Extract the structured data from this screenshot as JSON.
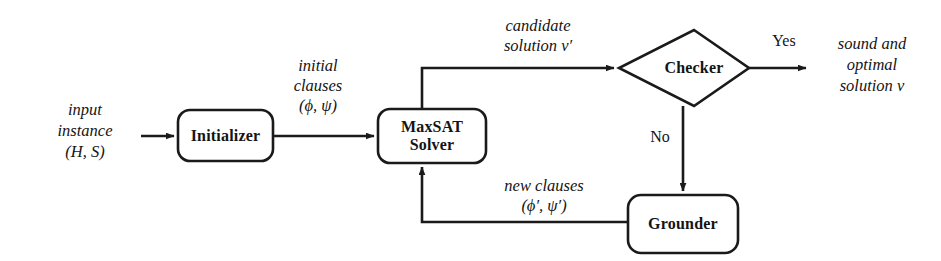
{
  "diagram": {
    "stroke_color": "#1a1a1a",
    "background_color": "#ffffff",
    "nodes": [
      {
        "id": "initializer",
        "label": "Initializer",
        "shape": "rounded-rect"
      },
      {
        "id": "maxsat_solver",
        "label": "MaxSAT\nSolver",
        "shape": "rounded-rect"
      },
      {
        "id": "checker",
        "label": "Checker",
        "shape": "diamond"
      },
      {
        "id": "grounder",
        "label": "Grounder",
        "shape": "rounded-rect"
      }
    ],
    "io": {
      "input": "input\ninstance\n(H, S)",
      "output": "sound and\noptimal\nsolution ν"
    },
    "edge_labels": {
      "initial_clauses": "initial\nclauses\n(ϕ, ψ)",
      "candidate_solution": "candidate\nsolution ν′",
      "new_clauses": "new clauses\n(ϕ′, ψ′)"
    },
    "branches": {
      "yes": "Yes",
      "no": "No"
    }
  }
}
